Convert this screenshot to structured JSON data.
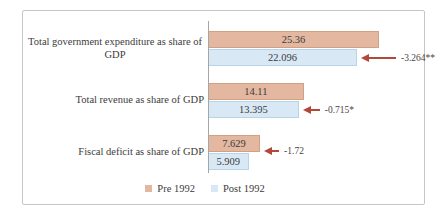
{
  "chart_data": {
    "type": "bar",
    "orientation": "horizontal",
    "title": "",
    "categories": [
      "Total government expenditure as share of GDP",
      "Total revenue as share of GDP",
      "Fiscal deficit as share of GDP"
    ],
    "series": [
      {
        "name": "Pre 1992",
        "color": "#e3b7a0",
        "values": [
          25.36,
          14.11,
          7.629
        ]
      },
      {
        "name": "Post 1992",
        "color": "#d9e8f5",
        "values": [
          22.096,
          13.395,
          5.909
        ]
      }
    ],
    "annotations": [
      {
        "label": "-3.264**",
        "points_to_series": "Post 1992",
        "category_index": 0
      },
      {
        "label": "-0.715*",
        "points_to_series": "Post 1992",
        "category_index": 1
      },
      {
        "label": "-1.72",
        "points_to_series": "Pre 1992",
        "category_index": 2
      }
    ],
    "legend": {
      "position": "bottom",
      "entries": [
        "Pre 1992",
        "Post 1992"
      ]
    },
    "axis": {
      "min": 0,
      "px_per_unit": 6.7,
      "axis_line_color": "#a6a6a6"
    },
    "arrow_color": "#b0493a",
    "grid": false,
    "frame_border_color": "#c6c6c6"
  }
}
